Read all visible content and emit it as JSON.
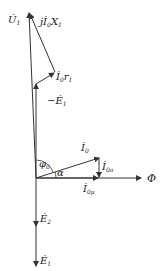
{
  "diagram": {
    "labels": {
      "u1": "U̇",
      "u1_sub": "1",
      "jix": "jİ",
      "jix_sub0": "0",
      "jix_x": "X",
      "jix_sub1": "1",
      "ir": "İ",
      "ir_sub": "0",
      "ir_r": "r",
      "ir_rsub": "1",
      "negE1": "−Ė",
      "negE1_sub": "1",
      "phi0": "φ",
      "phi0_sub": "0",
      "i0": "İ",
      "i0_sub": "0",
      "i0a": "İ",
      "i0a_sub": "0a",
      "alpha": "α",
      "i0mu": "İ",
      "i0mu_sub": "0μ",
      "flux": "Φ",
      "e2": "Ė",
      "e2_sub": "2",
      "e1": "Ė",
      "e1_sub": "1"
    },
    "colors": {
      "line": "#333333",
      "text": "#222222"
    }
  }
}
